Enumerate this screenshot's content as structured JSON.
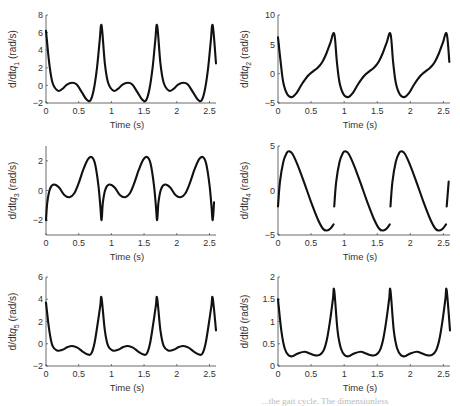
{
  "figure": {
    "caption_fragment": "...the gait cycle. The dimensionless"
  },
  "chart_data": [
    {
      "id": "q1",
      "type": "line",
      "title": "",
      "xlabel": "Time (s)",
      "ylabel": "d/dtq",
      "ylabel_sub": "1",
      "ylabel_unit": "(rad/s)",
      "xlim": [
        0,
        2.6
      ],
      "ylim": [
        -2,
        8
      ],
      "xticks": [
        0,
        0.5,
        1,
        1.5,
        2,
        2.5
      ],
      "xtick_labels": [
        "0",
        "0.5",
        "1",
        "1.5",
        "2",
        "2.5"
      ],
      "yticks": [
        -2,
        0,
        2,
        4,
        6,
        8
      ],
      "ytick_labels": [
        "−2",
        "0",
        "2",
        "4",
        "6",
        "8"
      ],
      "grid": false,
      "period": 0.85,
      "cycle": [
        [
          0,
          6.2
        ],
        [
          0.05,
          2.5
        ],
        [
          0.1,
          0.3
        ],
        [
          0.18,
          -0.6
        ],
        [
          0.25,
          -0.4
        ],
        [
          0.32,
          0.1
        ],
        [
          0.4,
          0.3
        ],
        [
          0.47,
          0.1
        ],
        [
          0.55,
          -0.8
        ],
        [
          0.62,
          -1.6
        ],
        [
          0.68,
          -1.7
        ],
        [
          0.73,
          -0.5
        ],
        [
          0.78,
          2.0
        ],
        [
          0.82,
          5.0
        ],
        [
          0.85,
          6.8
        ]
      ],
      "segments_continuous": true
    },
    {
      "id": "q2",
      "type": "line",
      "title": "",
      "xlabel": "Time (s)",
      "ylabel": "d/dtq",
      "ylabel_sub": "2",
      "ylabel_unit": "(rad/s)",
      "xlim": [
        0,
        2.6
      ],
      "ylim": [
        -5,
        10
      ],
      "xticks": [
        0,
        0.5,
        1,
        1.5,
        2,
        2.5
      ],
      "xtick_labels": [
        "0",
        "0.5",
        "1",
        "1.5",
        "2",
        "2.5"
      ],
      "yticks": [
        -5,
        0,
        5,
        10
      ],
      "ytick_labels": [
        "−5",
        "0",
        "5",
        "10"
      ],
      "grid": false,
      "period": 0.85,
      "cycle": [
        [
          0,
          6.2
        ],
        [
          0.04,
          2.0
        ],
        [
          0.08,
          -1.5
        ],
        [
          0.14,
          -3.5
        ],
        [
          0.21,
          -4.0
        ],
        [
          0.28,
          -3.3
        ],
        [
          0.36,
          -1.8
        ],
        [
          0.45,
          -0.4
        ],
        [
          0.53,
          0.4
        ],
        [
          0.6,
          1.0
        ],
        [
          0.67,
          2.0
        ],
        [
          0.73,
          3.4
        ],
        [
          0.79,
          5.2
        ],
        [
          0.85,
          6.8
        ]
      ],
      "segments_continuous": true
    },
    {
      "id": "q3",
      "type": "line",
      "title": "",
      "xlabel": "Time (s)",
      "ylabel": "d/dtq",
      "ylabel_sub": "3",
      "ylabel_unit": "(rad/s)",
      "xlim": [
        0,
        2.6
      ],
      "ylim": [
        -3,
        3
      ],
      "xticks": [
        0,
        0.5,
        1,
        1.5,
        2,
        2.5
      ],
      "xtick_labels": [
        "0",
        "0.5",
        "1",
        "1.5",
        "2",
        "2.5"
      ],
      "yticks": [
        -2,
        0,
        2
      ],
      "ytick_labels": [
        "−2",
        "0",
        "2"
      ],
      "grid": false,
      "period": 0.85,
      "cycle": [
        [
          0,
          -2.0
        ],
        [
          0.02,
          -0.8
        ],
        [
          0.06,
          0.1
        ],
        [
          0.12,
          0.4
        ],
        [
          0.2,
          0.2
        ],
        [
          0.28,
          -0.3
        ],
        [
          0.36,
          -0.45
        ],
        [
          0.43,
          -0.2
        ],
        [
          0.5,
          0.5
        ],
        [
          0.57,
          1.4
        ],
        [
          0.64,
          2.1
        ],
        [
          0.7,
          2.25
        ],
        [
          0.75,
          1.8
        ],
        [
          0.8,
          0.4
        ],
        [
          0.83,
          -1.0
        ],
        [
          0.85,
          -2.0
        ]
      ],
      "segments_continuous": true
    },
    {
      "id": "q4",
      "type": "line",
      "title": "",
      "xlabel": "Time (s)",
      "ylabel": "d/dtq",
      "ylabel_sub": "4",
      "ylabel_unit": "(rad/s)",
      "xlim": [
        0,
        2.6
      ],
      "ylim": [
        -5,
        5
      ],
      "xticks": [
        0,
        0.5,
        1,
        1.5,
        2,
        2.5
      ],
      "xtick_labels": [
        "0",
        "0.5",
        "1",
        "1.5",
        "2",
        "2.5"
      ],
      "yticks": [
        -5,
        0,
        5
      ],
      "ytick_labels": [
        "−5",
        "0",
        "5"
      ],
      "grid": false,
      "period": 0.85,
      "cycle": [
        [
          0,
          -1.8
        ],
        [
          0.03,
          1.0
        ],
        [
          0.08,
          3.2
        ],
        [
          0.13,
          4.2
        ],
        [
          0.17,
          4.4
        ],
        [
          0.22,
          4.1
        ],
        [
          0.3,
          2.8
        ],
        [
          0.4,
          0.8
        ],
        [
          0.5,
          -1.3
        ],
        [
          0.6,
          -3.2
        ],
        [
          0.68,
          -4.3
        ],
        [
          0.74,
          -4.5
        ],
        [
          0.79,
          -4.3
        ],
        [
          0.84,
          -3.8
        ]
      ],
      "segments_continuous": false
    },
    {
      "id": "q5",
      "type": "line",
      "title": "",
      "xlabel": "Time (s)",
      "ylabel": "d/dtq",
      "ylabel_sub": "5",
      "ylabel_unit": "(rad/s)",
      "xlim": [
        0,
        2.6
      ],
      "ylim": [
        -2,
        6
      ],
      "xticks": [
        0,
        0.5,
        1,
        1.5,
        2,
        2.5
      ],
      "xtick_labels": [
        "0",
        "0.5",
        "1",
        "1.5",
        "2",
        "2.5"
      ],
      "yticks": [
        -2,
        0,
        2,
        4,
        6
      ],
      "ytick_labels": [
        "−2",
        "0",
        "2",
        "4",
        "6"
      ],
      "grid": false,
      "period": 0.85,
      "cycle": [
        [
          0,
          3.7
        ],
        [
          0.05,
          1.2
        ],
        [
          0.1,
          -0.2
        ],
        [
          0.17,
          -0.6
        ],
        [
          0.25,
          -0.55
        ],
        [
          0.33,
          -0.3
        ],
        [
          0.4,
          -0.2
        ],
        [
          0.48,
          -0.35
        ],
        [
          0.56,
          -0.7
        ],
        [
          0.63,
          -0.95
        ],
        [
          0.69,
          -0.9
        ],
        [
          0.74,
          0.0
        ],
        [
          0.79,
          1.8
        ],
        [
          0.83,
          3.4
        ],
        [
          0.85,
          4.1
        ]
      ],
      "segments_continuous": true
    },
    {
      "id": "theta",
      "type": "line",
      "title": "",
      "xlabel": "Time (s)",
      "ylabel": "d/dtθ",
      "ylabel_sub": "",
      "ylabel_unit": "(rad/s)",
      "xlim": [
        0,
        2.6
      ],
      "ylim": [
        0,
        2
      ],
      "xticks": [
        0,
        0.5,
        1,
        1.5,
        2,
        2.5
      ],
      "xtick_labels": [
        "0",
        "0.5",
        "1",
        "1.5",
        "2",
        "2.5"
      ],
      "yticks": [
        0,
        0.5,
        1,
        1.5,
        2
      ],
      "ytick_labels": [
        "0",
        "0.5",
        "1",
        "1.5",
        "2"
      ],
      "grid": false,
      "period": 0.85,
      "cycle": [
        [
          0,
          1.5
        ],
        [
          0.05,
          0.8
        ],
        [
          0.1,
          0.4
        ],
        [
          0.16,
          0.24
        ],
        [
          0.22,
          0.22
        ],
        [
          0.3,
          0.28
        ],
        [
          0.4,
          0.32
        ],
        [
          0.48,
          0.28
        ],
        [
          0.56,
          0.24
        ],
        [
          0.63,
          0.25
        ],
        [
          0.69,
          0.35
        ],
        [
          0.74,
          0.6
        ],
        [
          0.79,
          1.05
        ],
        [
          0.83,
          1.5
        ],
        [
          0.85,
          1.7
        ]
      ],
      "segments_continuous": true
    }
  ]
}
